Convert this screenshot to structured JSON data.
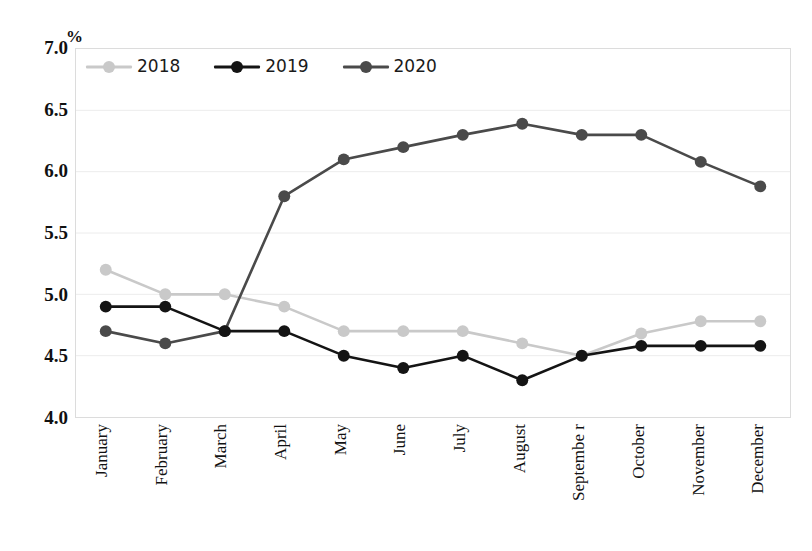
{
  "chart_data": {
    "type": "line",
    "title": "",
    "xlabel": "",
    "ylabel": "%",
    "unit_label": "%",
    "categories": [
      "January",
      "February",
      "March",
      "April",
      "May",
      "June",
      "July",
      "August",
      "September",
      "October",
      "November",
      "December"
    ],
    "category_display": [
      "January",
      "February",
      "March",
      "April",
      "May",
      "June",
      "July",
      "August",
      "Septembe r",
      "October",
      "November",
      "December"
    ],
    "series": [
      {
        "name": "2018",
        "color": "#c9c9c9",
        "values": [
          5.2,
          5.0,
          5.0,
          4.9,
          4.7,
          4.7,
          4.7,
          4.6,
          4.5,
          4.68,
          4.78,
          4.78
        ]
      },
      {
        "name": "2019",
        "color": "#141414",
        "values": [
          4.9,
          4.9,
          4.7,
          4.7,
          4.5,
          4.4,
          4.5,
          4.3,
          4.5,
          4.58,
          4.58,
          4.58
        ]
      },
      {
        "name": "2020",
        "color": "#4a4a4a",
        "values": [
          4.7,
          4.6,
          4.7,
          5.8,
          6.1,
          6.2,
          6.3,
          6.39,
          6.3,
          6.3,
          6.08,
          5.88
        ]
      }
    ],
    "ylim": [
      4.0,
      7.0
    ],
    "ytick_step": 0.5,
    "ytick_labels": [
      "7.0",
      "6.5",
      "6.0",
      "5.5",
      "5.0",
      "4.5",
      "4.0"
    ],
    "ytick_values": [
      7.0,
      6.5,
      6.0,
      5.5,
      5.0,
      4.5,
      4.0
    ],
    "grid": true,
    "grid_color": "#ececec",
    "legend_position": "top-left",
    "legend_entries": [
      "2018",
      "2019",
      "2020"
    ],
    "background": "#ffffff",
    "plot_border_color": "#dcdcdc"
  }
}
